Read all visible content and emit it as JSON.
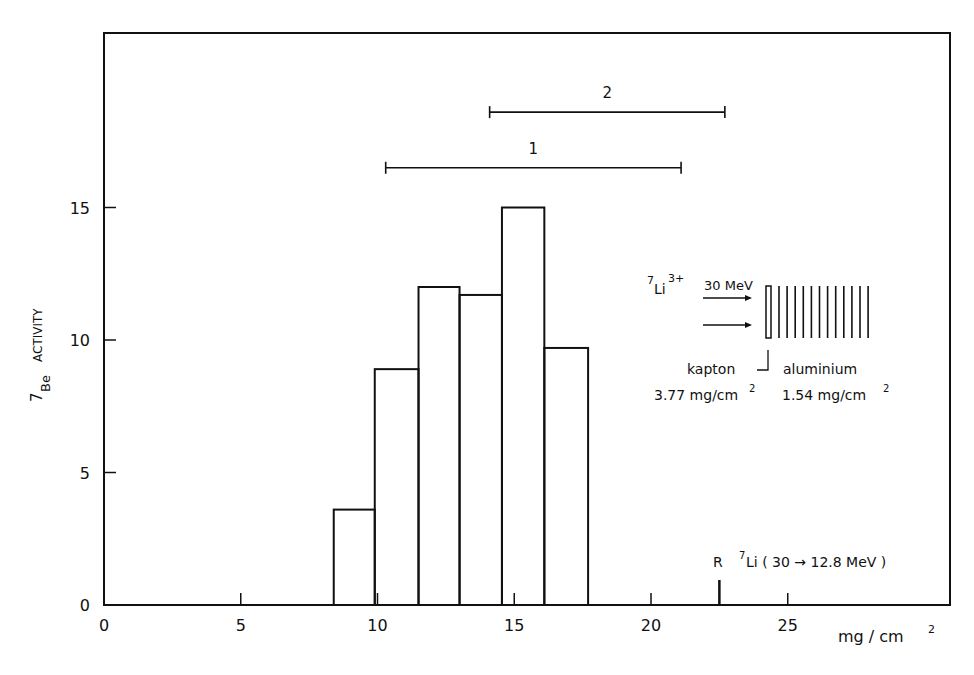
{
  "chart_data": {
    "type": "bar",
    "subtype": "histogram",
    "title": "",
    "xlabel": "mg/cm²",
    "ylabel": "7Be ACTIVITY",
    "ylabel_parts": {
      "superscript": "7",
      "subscript": "Be",
      "text": "ACTIVITY"
    },
    "xlim": [
      0,
      31
    ],
    "ylim": [
      0,
      20
    ],
    "x_ticks": [
      0,
      5,
      10,
      15,
      20,
      25
    ],
    "x_tick_labels": [
      "0",
      "5",
      "10",
      "15",
      "20",
      "25"
    ],
    "y_ticks": [
      0,
      5,
      10,
      15
    ],
    "y_tick_labels": [
      "0",
      "5",
      "10",
      "15"
    ],
    "grid": false,
    "bins": [
      {
        "x0": 8.4,
        "x1": 9.9,
        "value": 3.6
      },
      {
        "x0": 9.9,
        "x1": 11.5,
        "value": 8.9
      },
      {
        "x0": 11.5,
        "x1": 13.0,
        "value": 12.0
      },
      {
        "x0": 13.0,
        "x1": 14.55,
        "value": 11.7
      },
      {
        "x0": 14.55,
        "x1": 16.1,
        "value": 15.0
      },
      {
        "x0": 16.1,
        "x1": 17.7,
        "value": 9.7
      }
    ],
    "categories": [
      "8.4–9.9",
      "9.9–11.5",
      "11.5–13.0",
      "13.0–14.55",
      "14.55–16.1",
      "16.1–17.7"
    ],
    "values": [
      3.6,
      8.9,
      12.0,
      11.7,
      15.0,
      9.7
    ],
    "ranges": [
      {
        "label": "1",
        "x0": 10.3,
        "x1": 21.1,
        "y": 16.5
      },
      {
        "label": "2",
        "x0": 14.1,
        "x1": 22.7,
        "y": 18.6
      }
    ],
    "markers": [
      {
        "label": "R",
        "x": 22.5,
        "annotation": "7Li (30 → 12.8 MeV)"
      }
    ],
    "inset": {
      "beam": "7Li3+ 30 MeV",
      "beam_parts": {
        "pre": "7",
        "ion": "Li",
        "charge": "3+",
        "energy": "30 MeV"
      },
      "kapton_label": "kapton",
      "kapton_thickness": "3.77 mg/cm²",
      "aluminium_label": "aluminium",
      "aluminium_thickness": "1.54 mg/cm²",
      "foil_count": 13
    }
  },
  "labels": {
    "x_axis": "mg / cm",
    "x_axis_sup": "2",
    "y_axis_sup": "7",
    "y_axis_sub": "Be",
    "y_axis_main": "ACTIVITY",
    "range1": "1",
    "range2": "2",
    "marker_r": "R",
    "marker_sup": "7",
    "marker_text": "Li ( 30 → 12.8 MeV )",
    "inset_sup": "7",
    "inset_ion": "Li",
    "inset_charge": "3+",
    "inset_energy": "30 MeV",
    "inset_kapton": "kapton",
    "inset_aluminium": "aluminium",
    "inset_kapton_thick": "3.77 mg/cm",
    "inset_al_thick": "1.54 mg/cm",
    "inset_sq": "2"
  }
}
